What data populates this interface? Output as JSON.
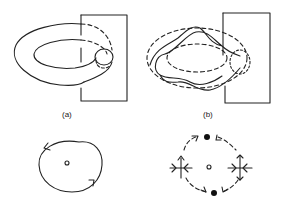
{
  "figure": {
    "panels": [
      {
        "id": "a",
        "label": "(a)",
        "top": "Torus with Poincaré section plane; closed tube orbit passing through section",
        "bottom": "Section view: closed invariant circle with arrows, center point"
      },
      {
        "id": "b",
        "label": "(b)",
        "top": "Torus (dashed) with wavy trajectory crossing section plane",
        "bottom": "Section view: dashed circle with two filled nodes (top, bottom) and two saddles (left, right), center point"
      }
    ],
    "colors": {
      "stroke": "#222222",
      "background": "#ffffff"
    }
  }
}
